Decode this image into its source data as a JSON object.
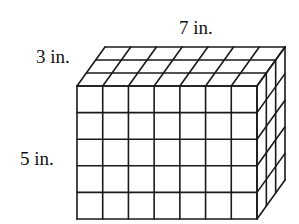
{
  "figure": {
    "type": "rectangular prism made of unit cubes",
    "dimensions": {
      "length": 7,
      "width": 3,
      "height": 5,
      "unit": "in."
    },
    "labels": {
      "length": "7 in.",
      "width": "3 in.",
      "height": "5 in."
    },
    "line_color": "#1a1a1a",
    "background": "#ffffff"
  }
}
